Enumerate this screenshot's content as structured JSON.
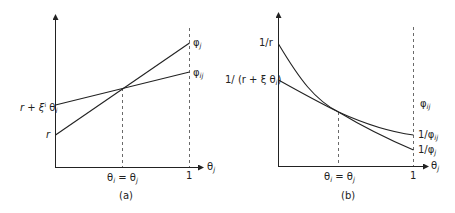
{
  "panels": [
    {
      "id": "a",
      "caption": "(a)",
      "x_axis_label": "θj",
      "x_ticks": [
        {
          "label": "θi = θj"
        },
        {
          "label": "1"
        }
      ],
      "y_labels": [
        {
          "label": "r + ξ θi"
        },
        {
          "label": "r"
        }
      ],
      "curves": [
        {
          "name": "φj",
          "shape": "line",
          "start_label": "r",
          "end_label": "φj"
        },
        {
          "name": "φij",
          "shape": "line",
          "start_label": "r + ξ θi",
          "end_label": "φij"
        }
      ]
    },
    {
      "id": "b",
      "caption": "(b)",
      "x_axis_label": "θj",
      "x_ticks": [
        {
          "label": "θi = θj"
        },
        {
          "label": "1"
        }
      ],
      "y_labels": [
        {
          "label": "1/r"
        },
        {
          "label": "1/ (r + ξ θi)"
        }
      ],
      "curves": [
        {
          "name": "1/φj",
          "shape": "convex-decreasing",
          "start_label": "1/r",
          "end_label": "1/φj"
        },
        {
          "name": "1/φij",
          "shape": "convex-decreasing",
          "start_label": "1/ (r + ξ θi)",
          "end_label": "1/φij"
        }
      ],
      "extra_label": "φij"
    }
  ],
  "text": {
    "a_y1_pre": "r + ξ",
    "a_y1_sup": "i",
    "a_y1_theta": "θ",
    "a_y1_sub": "i",
    "a_y2": "r",
    "a_phi": "φ",
    "a_phi_j_sub": "j",
    "a_phi_ij_sub": "ij",
    "a_xtick1_theta": "θ",
    "a_xtick1_sub_i": "i",
    "a_xtick1_eq": " = θ",
    "a_xtick1_sub_j": "j",
    "a_xtick2": "1",
    "a_xaxis": "θ",
    "a_xaxis_sub": "j",
    "a_caption": "(a)",
    "b_y1": "1/r",
    "b_y2_pre": "1/ (r + ξ",
    "b_y2_theta": "θ",
    "b_y2_sub": "i",
    "b_y2_close": ")",
    "b_phi_extra": "φ",
    "b_phi_extra_sub": "ij",
    "b_inv_ij": "1/φ",
    "b_inv_ij_sub": "ij",
    "b_inv_j": "1/φ",
    "b_inv_j_sub": "j",
    "b_xtick1_theta": "θ",
    "b_xtick1_sub_i": "i",
    "b_xtick1_eq": " = θ",
    "b_xtick1_sub_j": "j",
    "b_xtick2": "1",
    "b_xaxis": "θ",
    "b_xaxis_sub": "j",
    "b_caption": "(b)"
  }
}
